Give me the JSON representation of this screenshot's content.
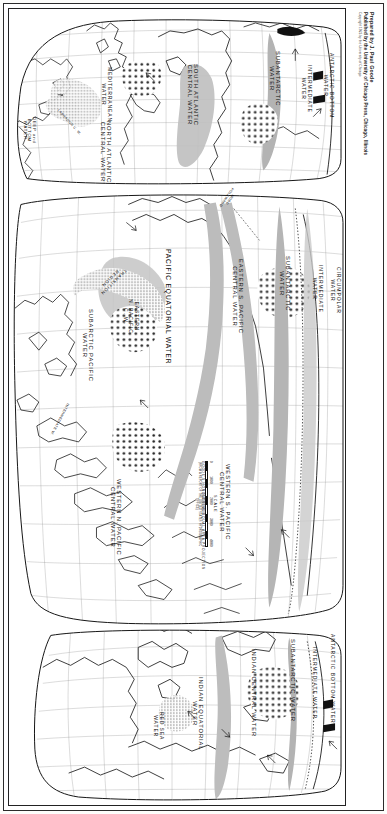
{
  "document": {
    "type": "map",
    "title": "World Ocean Water Masses",
    "projection": "GOODE'S HOMOLOSINE EQUAL AREA PROJECTION",
    "page_bg": "#ffffff",
    "ink_color": "#141414",
    "water_tint": "#b9b9b9"
  },
  "credit": {
    "line1": "Prepared by J. Paul Goode",
    "line2": "Published by the University of Chicago Press, Chicago, Illinois",
    "line3": "Copyright 1923 by the University of Chicago"
  },
  "scale": {
    "label": "SCALE",
    "ticks": [
      "0",
      "1000",
      "2000",
      "3000",
      "4000"
    ],
    "unit_note": "STATUTE MILES",
    "source_note": "(FROM A REPORT OF THE UNITED STATES HYDROGRAPHIC OFFICE)"
  },
  "projection_note": "GOODE'S HOMOLOSINE EQUAL AREA PROJECTION",
  "labels": {
    "atlantic": [
      {
        "id": "deep-bottom-water",
        "text": "DEEP and\nBOTTOM\nWATER",
        "x": 27,
        "y": 108,
        "size": "sz4"
      },
      {
        "id": "labrador-cw",
        "text": "LABRADOR C. W.",
        "x": 50,
        "y": 100,
        "size": "sz3",
        "rot": 48
      },
      {
        "id": "mediterranean-water",
        "text": "MEDITERRANEAN\nWATER",
        "x": 103,
        "y": 58,
        "size": "sz5"
      },
      {
        "id": "north-atlantic-central",
        "text": "NORTH ATLANTIC\nCENTRAL WATER",
        "x": 103,
        "y": 112,
        "size": "sz6"
      },
      {
        "id": "south-atlantic-central",
        "text": "SOUTH ATLANTIC\nCENTRAL WATER",
        "x": 190,
        "y": 55,
        "size": "sz6"
      },
      {
        "id": "subantarctic-water-atl",
        "text": "SUBANTARCTIC\nWATER",
        "x": 272,
        "y": 42,
        "size": "sz6"
      },
      {
        "id": "intermediate-water-atl",
        "text": "INTERMEDIATE\nWATER",
        "x": 303,
        "y": 56,
        "size": "sz5"
      },
      {
        "id": "antarctic-bottom-atl",
        "text": "ANTARCTIC BOTTOM\nWATER",
        "x": 325,
        "y": 44,
        "size": "sz5"
      }
    ],
    "pacific": [
      {
        "id": "subarctic-pacific-water",
        "text": "SUBARCTIC PACIFIC\nWATER",
        "x": 85,
        "y": 300,
        "size": "sz6"
      },
      {
        "id": "intermediate-w-pac",
        "text": "INTERMEDIATE W.",
        "x": 60,
        "y": 395,
        "size": "sz3",
        "rot": 118
      },
      {
        "id": "transition-region",
        "text": "TRANSITION\nREGION",
        "x": 118,
        "y": 262,
        "size": "sz4",
        "rot": 135
      },
      {
        "id": "eastern-n-pacific-cw",
        "text": "EASTERN\nN. PACIFIC\nC. W.",
        "x": 130,
        "y": 290,
        "size": "sz5"
      },
      {
        "id": "pacific-equatorial-water",
        "text": "PACIFIC EQUATORIAL WATER",
        "x": 163,
        "y": 240,
        "size": "sz7"
      },
      {
        "id": "western-n-pacific-central",
        "text": "WESTERN N. PACIFIC\nCENTRAL WATER",
        "x": 113,
        "y": 470,
        "size": "sz6"
      },
      {
        "id": "modd-poleward",
        "text": "MODD\nPOLEWARD",
        "x": 228,
        "y": 182,
        "size": "sz3",
        "rot": 125
      },
      {
        "id": "eastern-s-pacific-central",
        "text": "EASTERN S. PACIFIC\nCENTRAL WATER",
        "x": 235,
        "y": 250,
        "size": "sz6"
      },
      {
        "id": "western-s-pacific-central",
        "text": "WESTERN S. PACIFIC\nCENTRAL WATER",
        "x": 222,
        "y": 455,
        "size": "sz6"
      },
      {
        "id": "subantarctic-water-pac",
        "text": "SUBANTARCTIC\nWATER",
        "x": 282,
        "y": 247,
        "size": "sz6"
      },
      {
        "id": "intermediate-water-pac",
        "text": "INTERMEDIATE\nWATER",
        "x": 314,
        "y": 256,
        "size": "sz5"
      },
      {
        "id": "circumpolar-water",
        "text": "CIRCUMPOLAR\nWATER",
        "x": 332,
        "y": 258,
        "size": "sz5"
      }
    ],
    "indian": [
      {
        "id": "red-sea-water",
        "text": "RED SEA\nWATER",
        "x": 155,
        "y": 703,
        "size": "sz5"
      },
      {
        "id": "indian-equatorial-water",
        "text": "INDIAN EQUATORIAL\nWATER",
        "x": 195,
        "y": 668,
        "size": "sz6"
      },
      {
        "id": "indian-central-water",
        "text": "INDIAN CENTRAL WATER",
        "x": 248,
        "y": 640,
        "size": "sz6"
      },
      {
        "id": "subantarctic-water-ind",
        "text": "SUBANTARCTIC WATER",
        "x": 287,
        "y": 630,
        "size": "sz6"
      },
      {
        "id": "intermediate-water-ind",
        "text": "INTERMEDIATE WATER",
        "x": 308,
        "y": 638,
        "size": "sz5"
      },
      {
        "id": "antarctic-bottom-ind",
        "text": "ANTARCTIC BOTTOM WATER",
        "x": 326,
        "y": 625,
        "size": "sz5"
      }
    ]
  }
}
